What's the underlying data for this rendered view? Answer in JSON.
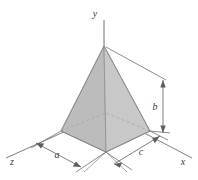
{
  "figure": {
    "kind": "engineering-diagram",
    "background_color": "#ffffff"
  },
  "axes": {
    "y": {
      "label": "y",
      "label_x": 95,
      "label_y": 16
    },
    "x": {
      "label": "x",
      "label_x": 182,
      "label_y": 164
    },
    "z": {
      "label": "z",
      "label_x": 11,
      "label_y": 164
    }
  },
  "dimensions": [
    {
      "id": "a",
      "label": "a",
      "label_x": 55,
      "label_y": 158,
      "orientation": "oblique-left"
    },
    {
      "id": "c",
      "label": "c",
      "label_x": 140,
      "label_y": 156,
      "orientation": "oblique-right"
    },
    {
      "id": "b",
      "label": "b",
      "label_x": 155,
      "label_y": 110,
      "orientation": "vertical"
    }
  ],
  "solid": {
    "name": "triangular-pyramid",
    "apex": {
      "x": 104,
      "y": 46
    },
    "base_vertices": [
      {
        "name": "left",
        "x": 61,
        "y": 131
      },
      {
        "name": "front",
        "x": 106,
        "y": 152
      },
      {
        "name": "right",
        "x": 150,
        "y": 131
      },
      {
        "name": "back",
        "x": 106,
        "y": 113
      }
    ],
    "face_fill_left": "#bdbdbd",
    "face_fill_right": "#c6c6c6",
    "face_fill_base": "#cfcfcf",
    "edge_color": "#8a8a8a",
    "hidden_edge_color": "#a5a5a5"
  },
  "line_color": "#6f6f6f"
}
